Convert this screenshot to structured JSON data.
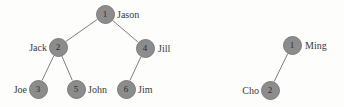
{
  "figure": {
    "background_color": "#fdfdfb",
    "node_fill_color": "#8c8c8c",
    "node_border_color": "#7a7a7a",
    "edge_color": "#6f6f6f",
    "label_color": "#3a3a3a",
    "node_number_color": "#2b2b2b"
  },
  "trees": [
    {
      "name": "left-tree",
      "nodes": [
        {
          "id": "L1",
          "number": "1",
          "label": "Jason",
          "x": 105,
          "y": 14,
          "label_side": "right",
          "label_x": 117,
          "label_y": 14
        },
        {
          "id": "L2",
          "number": "2",
          "label": "Jack",
          "x": 58,
          "y": 47,
          "label_side": "left",
          "label_x": 47,
          "label_y": 47
        },
        {
          "id": "L4",
          "number": "4",
          "label": "Jill",
          "x": 145,
          "y": 48,
          "label_side": "right",
          "label_x": 158,
          "label_y": 48
        },
        {
          "id": "L3",
          "number": "3",
          "label": "Joe",
          "x": 38,
          "y": 89,
          "label_side": "left",
          "label_x": 27,
          "label_y": 89
        },
        {
          "id": "L5",
          "number": "5",
          "label": "John",
          "x": 76,
          "y": 89,
          "label_side": "right",
          "label_x": 88,
          "label_y": 89
        },
        {
          "id": "L6",
          "number": "6",
          "label": "Jim",
          "x": 126,
          "y": 89,
          "label_side": "right",
          "label_x": 138,
          "label_y": 89
        }
      ],
      "edges": [
        {
          "from": "L1",
          "to": "L2"
        },
        {
          "from": "L1",
          "to": "L4"
        },
        {
          "from": "L2",
          "to": "L3"
        },
        {
          "from": "L2",
          "to": "L5"
        },
        {
          "from": "L4",
          "to": "L6"
        }
      ]
    },
    {
      "name": "right-tree",
      "nodes": [
        {
          "id": "R1",
          "number": "1",
          "label": "Ming",
          "x": 292,
          "y": 45,
          "label_side": "right",
          "label_x": 305,
          "label_y": 45
        },
        {
          "id": "R2",
          "number": "2",
          "label": "Cho",
          "x": 270,
          "y": 90,
          "label_side": "left",
          "label_x": 259,
          "label_y": 90
        }
      ],
      "edges": [
        {
          "from": "R1",
          "to": "R2"
        }
      ]
    }
  ]
}
